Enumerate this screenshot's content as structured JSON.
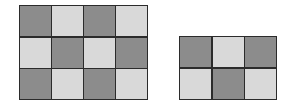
{
  "diagram": {
    "colors": {
      "dark": "#8c8c8c",
      "light": "#d9d9d9",
      "border": "#2b2b2b"
    },
    "grids": [
      {
        "id": "left",
        "rows": 3,
        "cols": 4,
        "cells": [
          [
            "dark",
            "light",
            "dark",
            "light"
          ],
          [
            "light",
            "dark",
            "light",
            "dark"
          ],
          [
            "dark",
            "light",
            "dark",
            "light"
          ]
        ]
      },
      {
        "id": "right",
        "rows": 2,
        "cols": 3,
        "cells": [
          [
            "dark",
            "light",
            "dark"
          ],
          [
            "light",
            "dark",
            "light"
          ]
        ]
      }
    ]
  }
}
